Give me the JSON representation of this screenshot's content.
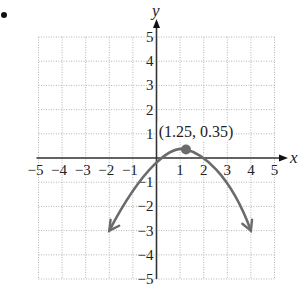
{
  "chart_data": {
    "type": "line",
    "title": "",
    "xlabel": "x",
    "ylabel": "y",
    "xlim": [
      -5,
      5
    ],
    "ylim": [
      -5,
      5
    ],
    "grid": true,
    "x_ticks": [
      "-5",
      "-4",
      "-3",
      "-2",
      "-1",
      "1",
      "2",
      "3",
      "4",
      "5"
    ],
    "y_ticks": [
      "5",
      "4",
      "3",
      "2",
      "1",
      "-1",
      "-2",
      "-3",
      "-4",
      "-5"
    ],
    "series": [
      {
        "name": "parabola",
        "color": "#6b6b6b",
        "points": [
          [
            -2,
            -3
          ],
          [
            -1,
            -1.25
          ],
          [
            0,
            -0.15
          ],
          [
            1.25,
            0.35
          ],
          [
            2,
            0.0
          ],
          [
            3,
            -1.2
          ],
          [
            4,
            -3
          ]
        ],
        "arrows": "both-ends"
      }
    ],
    "annotations": [
      {
        "label": "(1.25, 0.35)",
        "x": 1.25,
        "y": 0.35,
        "marker_color": "#6b6b6b"
      }
    ]
  },
  "labels": {
    "x_axis": "x",
    "y_axis": "y",
    "vertex": "(1.25, 0.35)"
  }
}
